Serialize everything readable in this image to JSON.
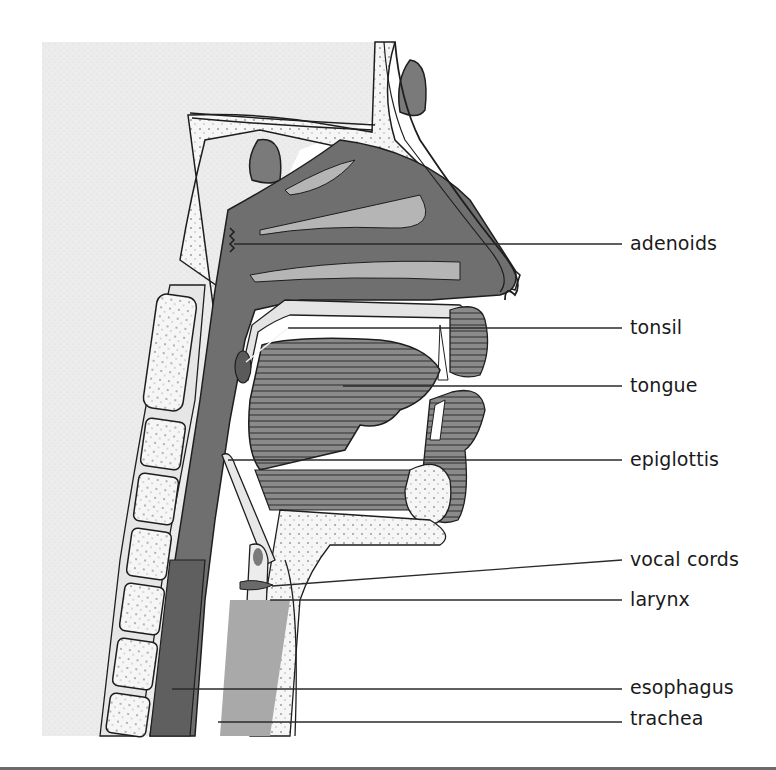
{
  "figure": {
    "colors": {
      "background": "#ffffff",
      "stipple_panel": "#ececec",
      "airway_dark": "#6f6f6f",
      "tissue_mid": "#9a9a9a",
      "tissue_light": "#d6d6d6",
      "bone": "#f4f4f4",
      "outline": "#1e1e1e",
      "leader_line": "#2a2a2a",
      "label_text": "#1a1a1a"
    }
  },
  "labels": [
    {
      "id": "adenoids",
      "text": "adenoids",
      "y": 245,
      "line": {
        "x1": 234,
        "y1": 244,
        "x2": 622,
        "y2": 244
      }
    },
    {
      "id": "tonsil",
      "text": "tonsil",
      "y": 330,
      "line": {
        "x1": 288,
        "y1": 328,
        "x2": 622,
        "y2": 328
      }
    },
    {
      "id": "tongue",
      "text": "tongue",
      "y": 388,
      "line": {
        "x1": 343,
        "y1": 386,
        "x2": 622,
        "y2": 386
      }
    },
    {
      "id": "epiglottis",
      "text": "epiglottis",
      "y": 462,
      "line": {
        "x1": 228,
        "y1": 460,
        "x2": 622,
        "y2": 460
      }
    },
    {
      "id": "vocal-cords",
      "text": "vocal cords",
      "y": 562,
      "line": {
        "x1": 272,
        "y1": 586,
        "x2": 622,
        "y2": 560
      }
    },
    {
      "id": "larynx",
      "text": "larynx",
      "y": 601,
      "line": {
        "x1": 270,
        "y1": 600,
        "x2": 622,
        "y2": 600
      }
    },
    {
      "id": "esophagus",
      "text": "esophagus",
      "y": 690,
      "line": {
        "x1": 172,
        "y1": 689,
        "x2": 622,
        "y2": 689
      }
    },
    {
      "id": "trachea",
      "text": "trachea",
      "y": 720,
      "line": {
        "x1": 218,
        "y1": 722,
        "x2": 622,
        "y2": 722
      }
    }
  ]
}
